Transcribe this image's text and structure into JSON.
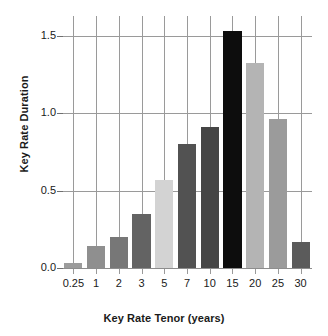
{
  "chart_data": {
    "type": "bar",
    "title": "",
    "xlabel": "Key Rate Tenor (years)",
    "ylabel": "Key Rate Duration",
    "categories": [
      "0.25",
      "1",
      "2",
      "3",
      "5",
      "7",
      "10",
      "15",
      "20",
      "25",
      "30"
    ],
    "values": [
      0.03,
      0.14,
      0.2,
      0.35,
      0.57,
      0.8,
      0.91,
      1.53,
      1.32,
      0.96,
      0.17
    ],
    "ylim": [
      0.0,
      1.6
    ],
    "yticks": [
      0.0,
      0.5,
      1.0,
      1.5
    ],
    "ytick_labels": [
      "0.0",
      "0.5",
      "1.0",
      "1.5"
    ],
    "grid": "both",
    "legend": "none",
    "bar_colors": [
      "#9c9c9c",
      "#8f8f8f",
      "#777777",
      "#636363",
      "#d3d3d3",
      "#525252",
      "#454545",
      "#0d0d0d",
      "#b4b4b4",
      "#9b9b9b",
      "#5b5b5b"
    ],
    "axis_color": "#9a9a9a",
    "text_color": "#1a1a1a"
  }
}
